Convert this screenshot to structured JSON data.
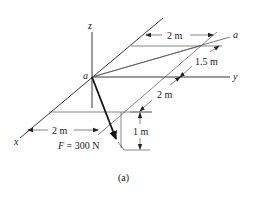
{
  "figure": {
    "caption": "(a)",
    "axes": {
      "x_label": "x",
      "y_label": "y",
      "z_label": "z",
      "origin_label": "a",
      "diagonal_end_label": "a"
    },
    "dimensions": {
      "top_width": "2 m",
      "diagonal_upper": "1.5 m",
      "diagonal_lower": "2 m",
      "bottom_width": "2 m",
      "vertical_drop": "1 m"
    },
    "force": {
      "label": "F = 300 N"
    },
    "colors": {
      "line": "#222222",
      "thin_line": "#555555",
      "background": "#ffffff"
    }
  }
}
